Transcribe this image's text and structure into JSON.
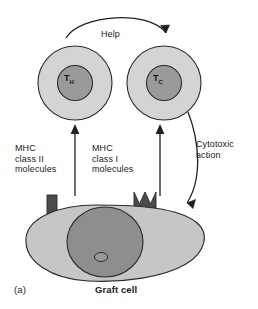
{
  "figure": {
    "panel_label": "(a)",
    "caption": "Graft cell"
  },
  "cells": {
    "helper_t": {
      "name": "T",
      "subscript": "H",
      "full_name": "Helper T cell",
      "cytoplasm_color": "#d4d4d4",
      "nucleus_color": "#9a9a9a"
    },
    "cytotoxic_t": {
      "name": "T",
      "subscript": "C",
      "full_name": "Cytotoxic T cell",
      "cytoplasm_color": "#d4d4d4",
      "nucleus_color": "#9a9a9a"
    },
    "graft": {
      "label": "Graft cell",
      "cytoplasm_color": "#c6c6c6",
      "nucleus_color": "#8e8e8e"
    }
  },
  "labels": {
    "help": "Help",
    "mhc_class_ii": "MHC\nclass II\nmolecules",
    "mhc_class_i": "MHC\nclass I\nmolecules",
    "cytotoxic_action": "Cytotoxic\naction"
  },
  "molecules": {
    "mhc_class_ii_shape": "rectangle",
    "mhc_class_i_shape": "trident",
    "color": "#4a4a4a"
  },
  "arrows": {
    "help_arrow": "curved-arrow-left-to-right",
    "mhc2_presentation": "arrow-up",
    "mhc1_presentation": "arrow-up",
    "cytotoxic_arrow": "curved-arrow-down-left"
  },
  "colors": {
    "outline": "#2b2b2b",
    "text": "#1a1a1a",
    "background": "#ffffff"
  }
}
